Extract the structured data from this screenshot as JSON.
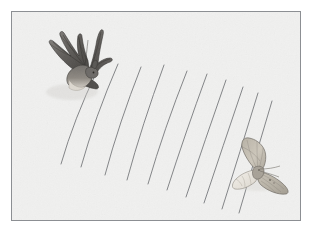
{
  "figure": {
    "title": "Bat echolocating a moth",
    "alt_text": "A dark bat at upper left emits curved echolocation sound waves toward a pale moth at lower right.",
    "background_color": "#f2f2f1",
    "frame_color": "#8c8f93",
    "page_color": "#ffffff"
  },
  "plate": {
    "x": 11,
    "y": 11,
    "width": 290,
    "height": 210,
    "border_width": 1
  },
  "bat": {
    "label": "bat",
    "role": "echolocation emitter",
    "position": {
      "x": 66,
      "y": 56
    },
    "body_color": "#6f6c69",
    "wing_color": "#5c5a58",
    "wing_dark_color": "#474543",
    "belly_color": "#d8d3cb",
    "outline_color": "#3b3936",
    "orientation": "flying down and to the right"
  },
  "moth": {
    "label": "moth",
    "role": "echolocation target",
    "position": {
      "x": 246,
      "y": 158
    },
    "body_color": "#a9a399",
    "wing_color": "#cfc9bd",
    "wing_pale_color": "#ece8e0",
    "wing_shadow_color": "#b6b0a4",
    "outline_color": "#6e6a63",
    "orientation": "wings spread, facing viewer"
  },
  "sound_waves": {
    "label": "echolocation sound waves",
    "stroke_color": "#6b6d70",
    "stroke_width": 0.9,
    "count": 10,
    "description": "nested curved arcs radiating from the bat toward the moth",
    "arcs": [
      {
        "id": 1,
        "x1": 96,
        "y1": 70,
        "cx": 73,
        "cy": 118,
        "x2": 60,
        "y2": 163
      },
      {
        "id": 2,
        "x1": 117,
        "y1": 63,
        "cx": 94,
        "cy": 116,
        "x2": 80,
        "y2": 166
      },
      {
        "id": 3,
        "x1": 140,
        "y1": 66,
        "cx": 118,
        "cy": 122,
        "x2": 104,
        "y2": 174
      },
      {
        "id": 4,
        "x1": 163,
        "y1": 64,
        "cx": 141,
        "cy": 124,
        "x2": 126,
        "y2": 179
      },
      {
        "id": 5,
        "x1": 186,
        "y1": 70,
        "cx": 163,
        "cy": 128,
        "x2": 147,
        "y2": 183
      },
      {
        "id": 6,
        "x1": 206,
        "y1": 73,
        "cx": 184,
        "cy": 133,
        "x2": 166,
        "y2": 189
      },
      {
        "id": 7,
        "x1": 225,
        "y1": 79,
        "cx": 204,
        "cy": 139,
        "x2": 185,
        "y2": 196
      },
      {
        "id": 8,
        "x1": 242,
        "y1": 86,
        "cx": 222,
        "cy": 145,
        "x2": 203,
        "y2": 202
      },
      {
        "id": 9,
        "x1": 257,
        "y1": 92,
        "cx": 239,
        "cy": 151,
        "x2": 221,
        "y2": 208
      },
      {
        "id": 10,
        "x1": 271,
        "y1": 100,
        "cx": 254,
        "cy": 157,
        "x2": 238,
        "y2": 212
      }
    ]
  },
  "paper": {
    "texture_label": "paper grain",
    "speckle_color": "#e6e5e3"
  }
}
